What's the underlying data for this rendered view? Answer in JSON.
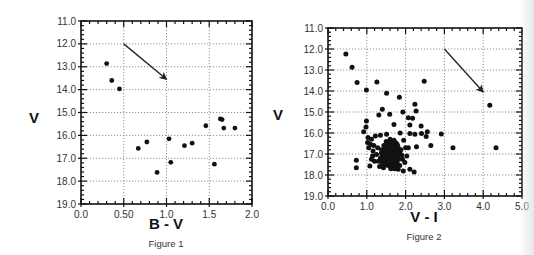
{
  "chart_data": [
    {
      "type": "scatter",
      "title": "",
      "caption": "Figure 1",
      "xlabel": "B - V",
      "ylabel": "V",
      "xlim": [
        0.0,
        2.0
      ],
      "ylim": [
        19.0,
        11.0
      ],
      "y_inverted": true,
      "xticks": [
        0.0,
        0.5,
        1.0,
        1.5,
        2.0
      ],
      "xtick_labels": [
        "0.0",
        "0.50",
        "1.0",
        "1.5",
        "2.0"
      ],
      "yticks": [
        11,
        12,
        13,
        14,
        15,
        16,
        17,
        18,
        19
      ],
      "ytick_labels": [
        "11.0",
        "12.0",
        "13.0",
        "14.0",
        "15.0",
        "16.0",
        "17.0",
        "18.0",
        "19.0"
      ],
      "grid": true,
      "grid_style": "dotted",
      "legend": null,
      "annotations": [
        {
          "type": "arrow",
          "from": [
            0.5,
            12.0
          ],
          "to": [
            1.0,
            13.55
          ],
          "note": "reddening vector"
        }
      ],
      "x": [
        0.3,
        0.36,
        0.45,
        0.67,
        0.77,
        0.89,
        1.03,
        1.05,
        1.21,
        1.3,
        1.46,
        1.56,
        1.63,
        1.65,
        1.67,
        1.8
      ],
      "y": [
        12.86,
        13.6,
        13.97,
        16.57,
        16.29,
        17.62,
        16.15,
        17.18,
        16.45,
        16.34,
        15.58,
        17.26,
        15.28,
        15.31,
        15.68,
        15.68
      ],
      "layout": {
        "left": 81,
        "top": 21,
        "right": 252,
        "bottom": 204,
        "ylabel_x": 34,
        "ylabel_y": 123,
        "xlabel_x": 166,
        "xlabel_y": 229,
        "caption_x": 166,
        "caption_y": 247
      }
    },
    {
      "type": "scatter",
      "title": "",
      "caption": "Figure 2",
      "xlabel": "V - I",
      "ylabel": "V",
      "xlim": [
        0.0,
        5.0
      ],
      "ylim": [
        19.0,
        11.0
      ],
      "y_inverted": true,
      "xticks": [
        0,
        1,
        2,
        3,
        4,
        5
      ],
      "xtick_labels": [
        "0.0",
        "1.0",
        "2.0",
        "3.0",
        "4.0",
        "5.0"
      ],
      "yticks": [
        11,
        12,
        13,
        14,
        15,
        16,
        17,
        18,
        19
      ],
      "ytick_labels": [
        "11.0",
        "12.0",
        "13.0",
        "14.0",
        "15.0",
        "16.0",
        "17.0",
        "18.0",
        "19.0"
      ],
      "grid": true,
      "grid_style": "dotted",
      "legend": null,
      "annotations": [
        {
          "type": "arrow",
          "from": [
            3.0,
            12.0
          ],
          "to": [
            4.0,
            14.05
          ],
          "note": "reddening vector"
        }
      ],
      "x": [
        0.46,
        0.62,
        0.75,
        1.26,
        0.99,
        1.51,
        1.84,
        2.48,
        2.24,
        2.27,
        1.4,
        1.31,
        1.59,
        1.93,
        2.07,
        2.18,
        1.7,
        0.99,
        0.98,
        0.92,
        2.11,
        2.4,
        2.56,
        2.41,
        2.92,
        1.86,
        2.11,
        2.24,
        2.53,
        2.65,
        3.22,
        2.28,
        2.07,
        0.73,
        0.73,
        1.03,
        1.12,
        1.22,
        1.35,
        1.51,
        1.05,
        1.16,
        1.12,
        1.08,
        1.25,
        1.81,
        1.94,
        2.11,
        2.22,
        2.0,
        2.03,
        1.98,
        4.17,
        4.33,
        1.02,
        1.1,
        1.18,
        1.28,
        1.38,
        1.45,
        1.5,
        1.55,
        1.6,
        1.65,
        1.7,
        1.75,
        1.8,
        1.85,
        1.42,
        1.48,
        1.53,
        1.58,
        1.63,
        1.68,
        1.73,
        1.78,
        1.44,
        1.52,
        1.57,
        1.62,
        1.67,
        1.72,
        1.77,
        1.82,
        1.47,
        1.55,
        1.6,
        1.65,
        1.7,
        1.75,
        1.5,
        1.58,
        1.63,
        1.68,
        1.73,
        1.4,
        1.35,
        1.3,
        1.88,
        1.9,
        1.95,
        1.15,
        1.2,
        1.33,
        1.43,
        1.62,
        1.72,
        1.85,
        1.92,
        1.38,
        1.48,
        1.57,
        1.67,
        1.77,
        1.55,
        1.65,
        1.6,
        1.7,
        1.52,
        1.62
      ],
      "y": [
        12.24,
        12.87,
        13.59,
        13.57,
        13.95,
        14.11,
        14.3,
        13.54,
        14.63,
        14.95,
        14.87,
        15.14,
        15.11,
        15.0,
        15.27,
        15.3,
        15.59,
        15.43,
        15.71,
        15.94,
        15.62,
        15.67,
        15.94,
        16.02,
        16.05,
        16.0,
        16.02,
        16.06,
        16.17,
        16.59,
        16.7,
        16.65,
        16.7,
        17.3,
        17.65,
        16.22,
        16.3,
        16.14,
        16.11,
        16.06,
        16.7,
        16.86,
        17.25,
        17.57,
        17.02,
        17.73,
        17.81,
        17.73,
        17.86,
        16.7,
        17.1,
        17.41,
        14.68,
        16.7,
        16.45,
        16.55,
        16.6,
        16.7,
        16.8,
        16.9,
        17.0,
        17.05,
        17.1,
        17.0,
        16.95,
        17.05,
        17.15,
        16.9,
        17.2,
        17.3,
        17.35,
        17.25,
        17.15,
        17.2,
        17.3,
        17.4,
        16.6,
        16.7,
        16.8,
        16.75,
        16.85,
        16.65,
        16.8,
        17.25,
        17.5,
        17.55,
        17.45,
        17.5,
        17.4,
        17.6,
        16.4,
        16.45,
        16.5,
        16.55,
        16.6,
        17.45,
        17.2,
        17.35,
        16.8,
        17.05,
        16.35,
        17.1,
        17.35,
        17.6,
        17.65,
        17.65,
        17.7,
        17.55,
        17.25,
        16.95,
        16.85,
        16.9,
        16.95,
        16.9,
        17.1,
        17.15,
        16.3,
        16.35,
        16.75,
        17.7
      ],
      "layout": {
        "left": 328,
        "top": 28,
        "right": 522,
        "bottom": 196,
        "ylabel_x": 278,
        "ylabel_y": 120,
        "xlabel_x": 424,
        "xlabel_y": 222,
        "caption_x": 424,
        "caption_y": 240
      }
    }
  ],
  "figures": [
    {
      "caption": "Figure 1",
      "xlabel": "B - V",
      "ylabel": "V"
    },
    {
      "caption": "Figure 2",
      "xlabel": "V - I",
      "ylabel": "V"
    }
  ],
  "colors": {
    "ink": "#111111",
    "grid": "#777777",
    "tick_text": "#333333",
    "background": "#ffffff"
  }
}
